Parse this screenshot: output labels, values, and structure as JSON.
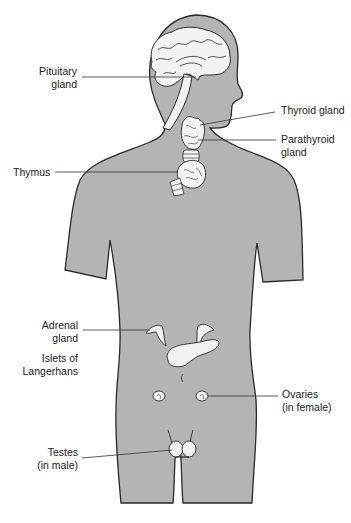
{
  "diagram": {
    "colors": {
      "body_fill": "#b4b4b4",
      "outline": "#2a2a2a",
      "organ_fill": "#f2f2f2",
      "leader_line": "#333333",
      "background": "#ffffff"
    },
    "labels": {
      "pituitary": {
        "line1": "Pituitary",
        "line2": "gland"
      },
      "thyroid": {
        "line1": "Thyroid gland"
      },
      "parathyroid": {
        "line1": "Parathyroid",
        "line2": "gland"
      },
      "thymus": {
        "line1": "Thymus"
      },
      "adrenal": {
        "line1": "Adrenal",
        "line2": "gland"
      },
      "islets": {
        "line1": "Islets of",
        "line2": "Langerhans"
      },
      "ovaries": {
        "line1": "Ovaries",
        "line2": "(in female)"
      },
      "testes": {
        "line1": "Testes",
        "line2": "(in male)"
      }
    }
  }
}
